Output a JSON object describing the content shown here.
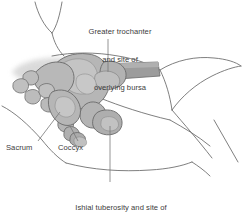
{
  "figure": {
    "type": "anatomical-illustration",
    "background_color": "#ffffff",
    "outline_color": "#5a5a5a",
    "bone_fill_color": "#b4b4b4",
    "bone_fill_light": "#c9c9c9",
    "femur_fill_color": "#9a9a9a",
    "shadow_color": "#d8d8d8",
    "leader_line_color": "#6e6e6e",
    "text_color": "#3c3c3c"
  },
  "labels": {
    "greater_trochanter": {
      "line1": "Greater trochanter",
      "line2": "and site of",
      "line3": "overlying bursa"
    },
    "ishial_tuberosity": {
      "line1": "Ishial tuberosity and site of",
      "line2": "overlying bursa"
    },
    "sacrum": "Sacrum",
    "coccyx": "Coccyx"
  }
}
